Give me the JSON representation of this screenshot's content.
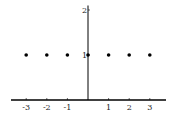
{
  "chart_data": {
    "type": "scatter",
    "title": "",
    "xlabel": "",
    "ylabel": "",
    "x": [
      -3,
      -2,
      -1,
      0,
      1,
      2,
      3
    ],
    "y": [
      1,
      1,
      1,
      1,
      1,
      1,
      1
    ],
    "xlim": [
      -3.7,
      3.7
    ],
    "ylim": [
      0,
      2.1
    ],
    "x_ticks": [
      -3,
      -2,
      -1,
      1,
      2,
      3
    ],
    "x_tick_labels": [
      "-3",
      "-2",
      "-1",
      "1",
      "2",
      "3"
    ],
    "y_ticks": [
      1,
      2
    ],
    "y_tick_labels": [
      "1",
      "2"
    ],
    "grid": false,
    "legend": null,
    "point_color": "#000000",
    "axis_color": "#000000"
  }
}
